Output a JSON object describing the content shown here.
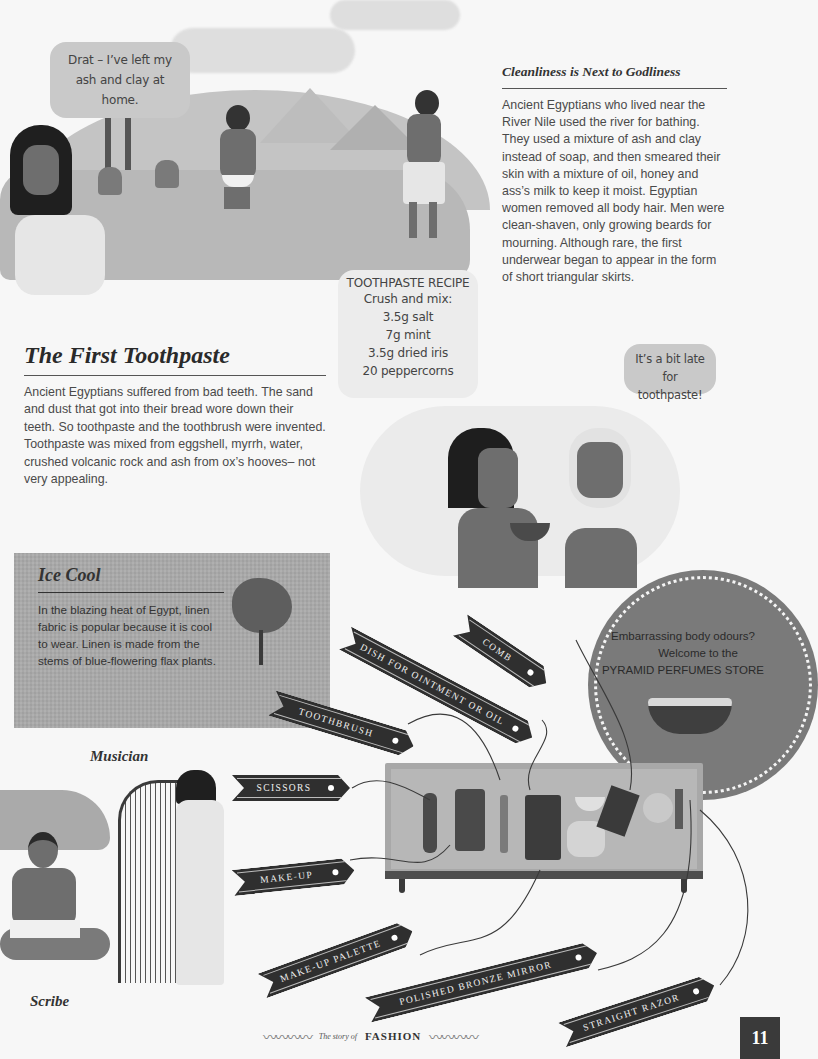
{
  "speech": {
    "woman": "Drat – I’ve left my ash and clay at home.",
    "recipe_title": "TOOTHPASTE RECIPE",
    "recipe_lines": [
      "Crush and mix:",
      "3.5g salt",
      "7g mint",
      "3.5g dried iris",
      "20 peppercorns"
    ],
    "patient": "It’s a bit late for toothpaste!"
  },
  "cleanliness": {
    "title": "Cleanliness is Next to Godliness",
    "body": "Ancient Egyptians who lived near the River Nile used the river for bathing. They used a mixture of ash and clay instead of soap, and then smeared their skin with a mixture of oil, honey and ass’s milk to keep it moist. Egyptian women removed all body hair. Men were clean-shaven, only growing beards for mourning. Although rare, the first underwear began to appear in the form of short triangular skirts."
  },
  "toothpaste": {
    "title": "The First Toothpaste",
    "body": "Ancient Egyptians suffered from bad teeth. The sand and dust that got into their bread wore down their teeth. So toothpaste and the toothbrush were invented. Toothpaste was mixed from eggshell, myrrh, water, crushed volcanic rock and ash from ox’s hooves– not very appealing."
  },
  "ice_cool": {
    "title": "Ice Cool",
    "body": "In the blazing heat of Egypt, linen fabric is popular because it is cool to wear. Linen is made from the stems of blue-flowering flax plants."
  },
  "perfume_store": {
    "line1": "Embarrassing body odours?",
    "line2": "Welcome to the",
    "line3": "PYRAMID PERFUMES STORE"
  },
  "tags": {
    "comb": "COMB",
    "dish": "DISH FOR OINTMENT OR OIL",
    "toothbrush": "TOOTHBRUSH",
    "scissors": "SCISSORS",
    "makeup": "MAKE-UP",
    "palette": "MAKE-UP PALETTE",
    "mirror": "POLISHED BRONZE MIRROR",
    "razor": "STRAIGHT RAZOR"
  },
  "labels": {
    "musician": "Musician",
    "scribe": "Scribe"
  },
  "footer": {
    "prefix": "The story of",
    "title": "FASHION",
    "page_number": "11"
  },
  "colors": {
    "ink": "#2f2f2f",
    "bubble": "#c9c9c9",
    "perfume_disc": "#7a7a7a",
    "linen": "#a9a9a9"
  }
}
